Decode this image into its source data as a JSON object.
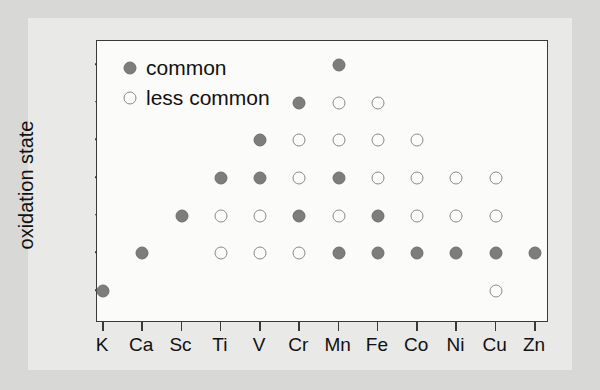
{
  "chart_data": {
    "type": "scatter",
    "title": "",
    "subtitle": "",
    "xlabel": "",
    "ylabel": "oxidation state",
    "categories": [
      "K",
      "Ca",
      "Sc",
      "Ti",
      "V",
      "Cr",
      "Mn",
      "Fe",
      "Co",
      "Ni",
      "Cu",
      "Zn"
    ],
    "y_ticks": [
      "+1",
      "+2",
      "+3",
      "+4",
      "+5",
      "+6",
      "+7"
    ],
    "y_values": [
      1,
      2,
      3,
      4,
      5,
      6,
      7
    ],
    "ylim": [
      0,
      7.6
    ],
    "grid": false,
    "legend_position": "upper-left-inside",
    "legend": [
      {
        "key": "common",
        "label": "common",
        "marker": "filled-circle",
        "color": "#7d7d7d"
      },
      {
        "key": "less_common",
        "label": "less common",
        "marker": "open-circle",
        "color": "#fbfbfa"
      }
    ],
    "series": [
      {
        "name": "common",
        "style": "filled-circle",
        "points": [
          {
            "x": "K",
            "y": 1
          },
          {
            "x": "Ca",
            "y": 2
          },
          {
            "x": "Sc",
            "y": 3
          },
          {
            "x": "Ti",
            "y": 4
          },
          {
            "x": "V",
            "y": 4
          },
          {
            "x": "V",
            "y": 5
          },
          {
            "x": "Cr",
            "y": 3
          },
          {
            "x": "Cr",
            "y": 6
          },
          {
            "x": "Mn",
            "y": 2
          },
          {
            "x": "Mn",
            "y": 4
          },
          {
            "x": "Mn",
            "y": 7
          },
          {
            "x": "Fe",
            "y": 2
          },
          {
            "x": "Fe",
            "y": 3
          },
          {
            "x": "Co",
            "y": 2
          },
          {
            "x": "Ni",
            "y": 2
          },
          {
            "x": "Cu",
            "y": 2
          },
          {
            "x": "Zn",
            "y": 2
          }
        ]
      },
      {
        "name": "less common",
        "style": "open-circle",
        "points": [
          {
            "x": "Ti",
            "y": 2
          },
          {
            "x": "Ti",
            "y": 3
          },
          {
            "x": "V",
            "y": 2
          },
          {
            "x": "V",
            "y": 3
          },
          {
            "x": "Cr",
            "y": 2
          },
          {
            "x": "Cr",
            "y": 4
          },
          {
            "x": "Cr",
            "y": 5
          },
          {
            "x": "Mn",
            "y": 3
          },
          {
            "x": "Mn",
            "y": 5
          },
          {
            "x": "Mn",
            "y": 6
          },
          {
            "x": "Fe",
            "y": 4
          },
          {
            "x": "Fe",
            "y": 5
          },
          {
            "x": "Fe",
            "y": 6
          },
          {
            "x": "Co",
            "y": 3
          },
          {
            "x": "Co",
            "y": 4
          },
          {
            "x": "Co",
            "y": 5
          },
          {
            "x": "Ni",
            "y": 3
          },
          {
            "x": "Ni",
            "y": 4
          },
          {
            "x": "Cu",
            "y": 1
          },
          {
            "x": "Cu",
            "y": 3
          },
          {
            "x": "Cu",
            "y": 4
          }
        ]
      }
    ],
    "colors": {
      "common_fill": "#7d7d7d",
      "less_common_stroke": "#8a8a8a",
      "axis": "#3a3a3a",
      "plot_background": "#fbfbfa",
      "page_background": "#e9e9e7",
      "outer_background": "#d8d8d6"
    }
  }
}
